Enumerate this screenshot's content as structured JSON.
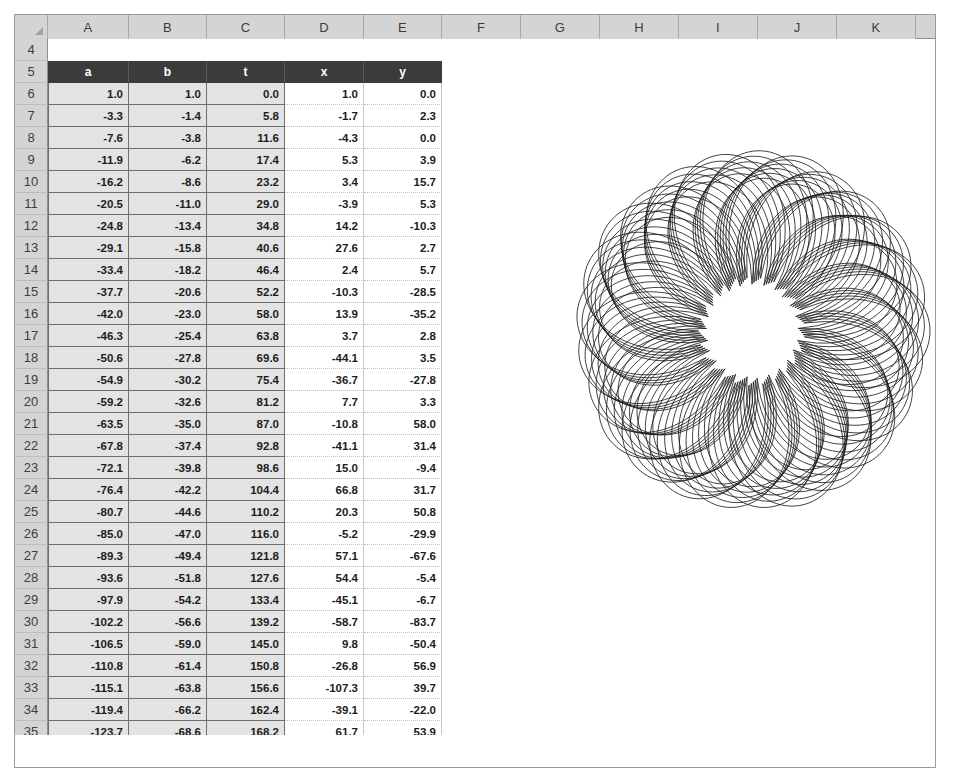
{
  "app": {
    "kind": "spreadsheet",
    "corner_icon": "select-all-triangle-icon"
  },
  "grid": {
    "column_headers": [
      "A",
      "B",
      "C",
      "D",
      "E",
      "F",
      "G",
      "H",
      "I",
      "J",
      "K"
    ],
    "row_headers": [
      "4",
      "5",
      "6",
      "7",
      "8",
      "9",
      "10",
      "11",
      "12",
      "13",
      "14",
      "15",
      "16",
      "17",
      "18",
      "19",
      "20",
      "21",
      "22",
      "23",
      "24",
      "25",
      "26",
      "27",
      "28",
      "29",
      "30",
      "31",
      "32",
      "33",
      "34",
      "35"
    ],
    "first_visible_row": 4,
    "table_header_row": "5",
    "table_headers": [
      "a",
      "b",
      "t",
      "x",
      "y"
    ],
    "colors": {
      "header_band_bg": "#3b3b3b",
      "header_band_text": "#ffffff",
      "shaded_cells_bg": "#e3e3e3",
      "plain_cells_bg": "#ffffff",
      "gutter_bg": "#d4d4d4",
      "curve_stroke": "#1a1a1a"
    }
  },
  "chart_data": {
    "type": "line",
    "title": "",
    "xlabel": "",
    "ylabel": "",
    "series": [
      {
        "name": "xy-curve",
        "x_column": "x",
        "y_column": "y",
        "petals": 5,
        "stroke": "#1a1a1a",
        "stroke_width": 0.9
      }
    ],
    "legend": "none",
    "grid": false
  },
  "table": {
    "columns": [
      "a",
      "b",
      "t",
      "x",
      "y"
    ],
    "rows": [
      {
        "r": "6",
        "a": "1.0",
        "b": "1.0",
        "t": "0.0",
        "x": "1.0",
        "y": "0.0"
      },
      {
        "r": "7",
        "a": "-3.3",
        "b": "-1.4",
        "t": "5.8",
        "x": "-1.7",
        "y": "2.3"
      },
      {
        "r": "8",
        "a": "-7.6",
        "b": "-3.8",
        "t": "11.6",
        "x": "-4.3",
        "y": "0.0"
      },
      {
        "r": "9",
        "a": "-11.9",
        "b": "-6.2",
        "t": "17.4",
        "x": "5.3",
        "y": "3.9"
      },
      {
        "r": "10",
        "a": "-16.2",
        "b": "-8.6",
        "t": "23.2",
        "x": "3.4",
        "y": "15.7"
      },
      {
        "r": "11",
        "a": "-20.5",
        "b": "-11.0",
        "t": "29.0",
        "x": "-3.9",
        "y": "5.3"
      },
      {
        "r": "12",
        "a": "-24.8",
        "b": "-13.4",
        "t": "34.8",
        "x": "14.2",
        "y": "-10.3"
      },
      {
        "r": "13",
        "a": "-29.1",
        "b": "-15.8",
        "t": "40.6",
        "x": "27.6",
        "y": "2.7"
      },
      {
        "r": "14",
        "a": "-33.4",
        "b": "-18.2",
        "t": "46.4",
        "x": "2.4",
        "y": "5.7"
      },
      {
        "r": "15",
        "a": "-37.7",
        "b": "-20.6",
        "t": "52.2",
        "x": "-10.3",
        "y": "-28.5"
      },
      {
        "r": "16",
        "a": "-42.0",
        "b": "-23.0",
        "t": "58.0",
        "x": "13.9",
        "y": "-35.2"
      },
      {
        "r": "17",
        "a": "-46.3",
        "b": "-25.4",
        "t": "63.8",
        "x": "3.7",
        "y": "2.8"
      },
      {
        "r": "18",
        "a": "-50.6",
        "b": "-27.8",
        "t": "69.6",
        "x": "-44.1",
        "y": "3.5"
      },
      {
        "r": "19",
        "a": "-54.9",
        "b": "-30.2",
        "t": "75.4",
        "x": "-36.7",
        "y": "-27.8"
      },
      {
        "r": "20",
        "a": "-59.2",
        "b": "-32.6",
        "t": "81.2",
        "x": "7.7",
        "y": "3.3"
      },
      {
        "r": "21",
        "a": "-63.5",
        "b": "-35.0",
        "t": "87.0",
        "x": "-10.8",
        "y": "58.0"
      },
      {
        "r": "22",
        "a": "-67.8",
        "b": "-37.4",
        "t": "92.8",
        "x": "-41.1",
        "y": "31.4"
      },
      {
        "r": "23",
        "a": "-72.1",
        "b": "-39.8",
        "t": "98.6",
        "x": "15.0",
        "y": "-9.4"
      },
      {
        "r": "24",
        "a": "-76.4",
        "b": "-42.2",
        "t": "104.4",
        "x": "66.8",
        "y": "31.7"
      },
      {
        "r": "25",
        "a": "-80.7",
        "b": "-44.6",
        "t": "110.2",
        "x": "20.3",
        "y": "50.8"
      },
      {
        "r": "26",
        "a": "-85.0",
        "b": "-47.0",
        "t": "116.0",
        "x": "-5.2",
        "y": "-29.9"
      },
      {
        "r": "27",
        "a": "-89.3",
        "b": "-49.4",
        "t": "121.8",
        "x": "57.1",
        "y": "-67.6"
      },
      {
        "r": "28",
        "a": "-93.6",
        "b": "-51.8",
        "t": "127.6",
        "x": "54.4",
        "y": "-5.4"
      },
      {
        "r": "29",
        "a": "-97.9",
        "b": "-54.2",
        "t": "133.4",
        "x": "-45.1",
        "y": "-6.7"
      },
      {
        "r": "30",
        "a": "-102.2",
        "b": "-56.6",
        "t": "139.2",
        "x": "-58.7",
        "y": "-83.7"
      },
      {
        "r": "31",
        "a": "-106.5",
        "b": "-59.0",
        "t": "145.0",
        "x": "9.8",
        "y": "-50.4"
      },
      {
        "r": "32",
        "a": "-110.8",
        "b": "-61.4",
        "t": "150.8",
        "x": "-26.8",
        "y": "56.9"
      },
      {
        "r": "33",
        "a": "-115.1",
        "b": "-63.8",
        "t": "156.6",
        "x": "-107.3",
        "y": "39.7"
      },
      {
        "r": "34",
        "a": "-119.4",
        "b": "-66.2",
        "t": "162.4",
        "x": "-39.1",
        "y": "-22.0"
      },
      {
        "r": "35",
        "a": "-123.7",
        "b": "-68.6",
        "t": "168.2",
        "x": "61.7",
        "y": "53.9"
      }
    ]
  }
}
